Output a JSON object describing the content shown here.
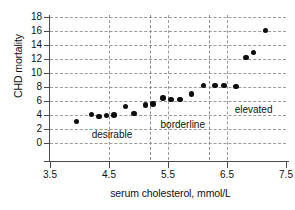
{
  "chart_data": {
    "type": "scatter",
    "title": "",
    "xlabel": "serum cholesterol, mmol/L",
    "ylabel": "CHD mortality",
    "xlim": [
      3.5,
      7.5
    ],
    "ylim": [
      0,
      18
    ],
    "xticks": [
      3.5,
      4.5,
      5.5,
      6.5,
      7.5
    ],
    "xtick_labels": [
      "3.5",
      "4.5",
      "5.5",
      "6.5",
      "7.5"
    ],
    "yticks": [
      0,
      2,
      4,
      6,
      8,
      10,
      12,
      14,
      16,
      18
    ],
    "ytick_labels": [
      "0",
      "2",
      "4",
      "6",
      "8",
      "10",
      "12",
      "14",
      "16",
      "18"
    ],
    "grid": true,
    "grid_style": "dashed",
    "legend": "none",
    "marker": "filled-circle",
    "marker_color": "#0d0d0d",
    "points": [
      {
        "x": 3.95,
        "y": 3.1
      },
      {
        "x": 4.2,
        "y": 4.1
      },
      {
        "x": 4.33,
        "y": 3.8
      },
      {
        "x": 4.46,
        "y": 3.9
      },
      {
        "x": 4.58,
        "y": 4.0
      },
      {
        "x": 4.78,
        "y": 5.2
      },
      {
        "x": 4.92,
        "y": 4.2
      },
      {
        "x": 5.12,
        "y": 5.4
      },
      {
        "x": 5.25,
        "y": 5.6
      },
      {
        "x": 5.42,
        "y": 6.4
      },
      {
        "x": 5.55,
        "y": 6.2
      },
      {
        "x": 5.7,
        "y": 6.2
      },
      {
        "x": 5.9,
        "y": 7.0
      },
      {
        "x": 6.1,
        "y": 8.2
      },
      {
        "x": 6.3,
        "y": 8.2
      },
      {
        "x": 6.45,
        "y": 8.2
      },
      {
        "x": 6.65,
        "y": 8.1
      },
      {
        "x": 6.82,
        "y": 12.2
      },
      {
        "x": 6.95,
        "y": 12.9
      },
      {
        "x": 7.15,
        "y": 16.1
      }
    ],
    "zone_dividers": [
      5.2,
      6.2
    ],
    "annotations": [
      {
        "text": "desirable",
        "x": 4.55,
        "y": 1.1
      },
      {
        "text": "borderline",
        "x": 5.75,
        "y": 2.6
      },
      {
        "text": "elevated",
        "x": 6.95,
        "y": 4.7
      }
    ]
  }
}
